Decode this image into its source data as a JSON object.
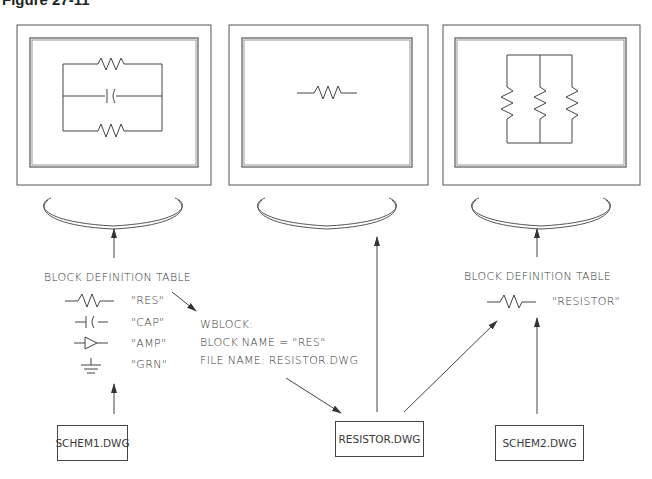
{
  "figure": {
    "title": "Figure 27-11"
  },
  "monitors": [
    {
      "id": "left",
      "screen_content": "parallel circuit: resistor, capacitor, resistor"
    },
    {
      "id": "middle",
      "screen_content": "single resistor"
    },
    {
      "id": "right",
      "screen_content": "three resistors in parallel (vertical)"
    }
  ],
  "left_table": {
    "heading": "BLOCK DEFINITION TABLE",
    "rows": [
      {
        "symbol": "resistor",
        "name": "\"RES\""
      },
      {
        "symbol": "capacitor",
        "name": "\"CAP\""
      },
      {
        "symbol": "amplifier",
        "name": "\"AMP\""
      },
      {
        "symbol": "ground",
        "name": "\"GRN\""
      }
    ]
  },
  "wblock": {
    "line1": "WBLOCK:",
    "line2": "BLOCK  NAME  =  \"RES\"",
    "line3": "FILE  NAME:    RESISTOR.DWG"
  },
  "right_table": {
    "heading": "BLOCK  DEFINITION  TABLE",
    "rows": [
      {
        "symbol": "resistor",
        "name": "\"RESISTOR\""
      }
    ]
  },
  "files": {
    "schem1": "SCHEM1.DWG",
    "resistor": "RESISTOR.DWG",
    "schem2": "SCHEM2.DWG"
  },
  "colors": {
    "line": "#444444",
    "text": "#3a3a3a",
    "background": "#ffffff"
  }
}
